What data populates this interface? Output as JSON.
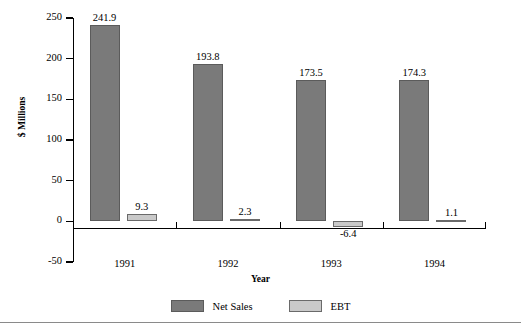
{
  "chart_data": {
    "type": "bar",
    "title": "",
    "xlabel": "Year",
    "ylabel": "$ Millions",
    "categories": [
      "1991",
      "1992",
      "1993",
      "1994"
    ],
    "series": [
      {
        "name": "Net Sales",
        "color": "#7a7a7a",
        "values": [
          241.9,
          193.8,
          173.5,
          174.3
        ],
        "labels": [
          "241.9",
          "193.8",
          "173.5",
          "174.3"
        ]
      },
      {
        "name": "EBT",
        "color": "#c9c9c9",
        "values": [
          9.3,
          2.3,
          -6.4,
          1.1
        ],
        "labels": [
          "9.3",
          "2.3",
          "-6.4",
          "1.1"
        ]
      }
    ],
    "ylim": [
      -50,
      250
    ],
    "yticks": [
      250,
      200,
      150,
      100,
      50,
      0,
      -50
    ],
    "ytick_labels": [
      "250",
      "200",
      "150",
      "100",
      "50",
      "0",
      "-50"
    ],
    "grid": false,
    "legend_position": "bottom-center"
  },
  "axes": {
    "y_title": "$ Millions",
    "x_title": "Year",
    "y_tick_labels": [
      "250",
      "200",
      "150",
      "100",
      "50",
      "0",
      "-50"
    ],
    "x_tick_labels": [
      "1991",
      "1992",
      "1993",
      "1994"
    ]
  },
  "legend": {
    "items": [
      {
        "label": "Net Sales",
        "color": "#7a7a7a"
      },
      {
        "label": "EBT",
        "color": "#c9c9c9"
      }
    ]
  },
  "bar_labels": {
    "net_sales": [
      "241.9",
      "193.8",
      "173.5",
      "174.3"
    ],
    "ebt": [
      "9.3",
      "2.3",
      "-6.4",
      "1.1"
    ]
  }
}
